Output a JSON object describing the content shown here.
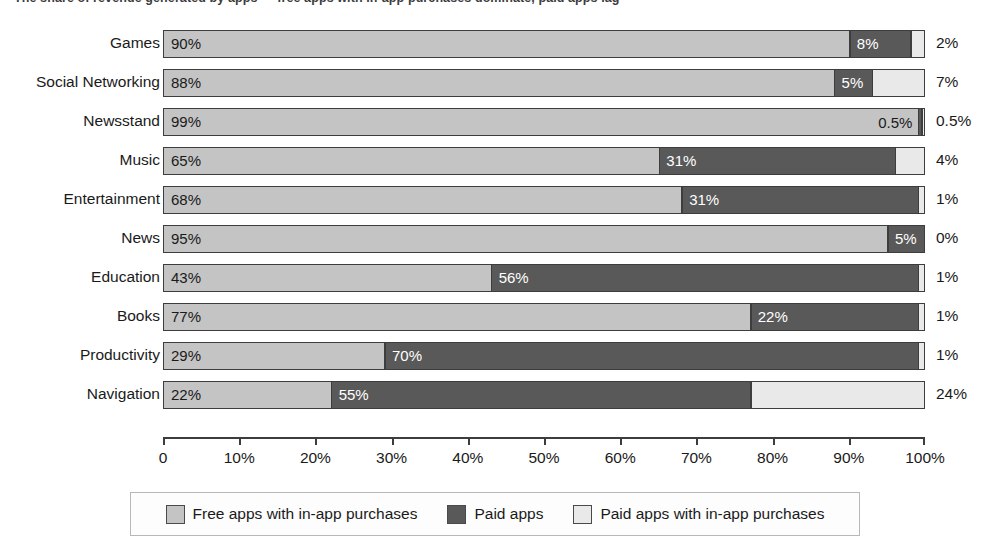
{
  "chart_title": "The share of revenue generated by apps — free apps with in-app purchases dominate, paid apps lag",
  "chart_data": {
    "type": "bar",
    "orientation": "horizontal",
    "stacked": true,
    "title": "",
    "xlabel": "",
    "ylabel": "",
    "xlim": [
      0,
      100
    ],
    "grid": false,
    "legend_position": "bottom",
    "categories": [
      "Games",
      "Social Networking",
      "Newsstand",
      "Music",
      "Entertainment",
      "News",
      "Education",
      "Books",
      "Productivity",
      "Navigation"
    ],
    "series": [
      {
        "name": "Free apps with in-app purchases",
        "color": "#c4c4c4",
        "values": [
          90,
          88,
          99,
          65,
          68,
          95,
          43,
          77,
          29,
          22
        ],
        "labels": [
          "90%",
          "88%",
          "99%",
          "65%",
          "68%",
          "95%",
          "43%",
          "77%",
          "29%",
          "22%"
        ]
      },
      {
        "name": "Paid apps",
        "color": "#595959",
        "values": [
          8,
          5,
          0.5,
          31,
          31,
          5,
          56,
          22,
          70,
          55
        ],
        "labels": [
          "8%",
          "5%",
          "0.5%",
          "31%",
          "31%",
          "5%",
          "56%",
          "22%",
          "70%",
          "55%"
        ]
      },
      {
        "name": "Paid apps with in-app purchases",
        "color": "#e9e9e9",
        "values": [
          2,
          7,
          0.5,
          4,
          1,
          0,
          1,
          1,
          1,
          24
        ],
        "labels": [
          "2%",
          "7%",
          "0.5%",
          "4%",
          "1%",
          "0%",
          "1%",
          "1%",
          "1%",
          "24%"
        ]
      }
    ],
    "xticks": [
      0,
      10,
      20,
      30,
      40,
      50,
      60,
      70,
      80,
      90,
      100
    ],
    "xtick_labels": [
      "0",
      "10%",
      "20%",
      "30%",
      "40%",
      "50%",
      "60%",
      "70%",
      "80%",
      "90%",
      "100%"
    ]
  },
  "legend": {
    "items": [
      {
        "label": "Free apps with in-app purchases",
        "color": "#c4c4c4"
      },
      {
        "label": "Paid apps",
        "color": "#595959"
      },
      {
        "label": "Paid apps with in-app purchases",
        "color": "#e9e9e9"
      }
    ]
  }
}
